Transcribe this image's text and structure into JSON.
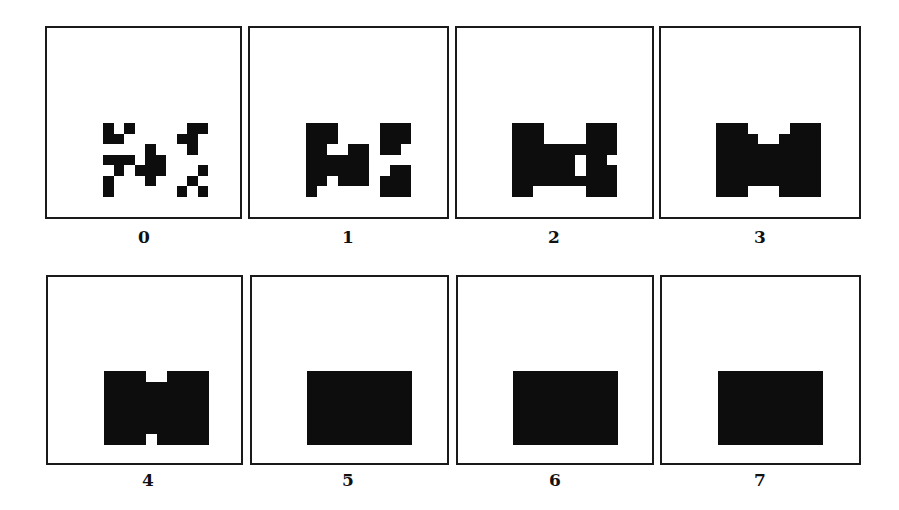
{
  "figure": {
    "grid": {
      "cols": 10,
      "rows": 7,
      "cell_color": "#0d0d0d",
      "background": "#ffffff"
    },
    "panels": [
      {
        "label": "0",
        "rows": [
          "X.X.....XX",
          "XX.....XX.",
          "....X...X.",
          "XXX.XX....",
          ".X.XXX...X",
          "X...X...X.",
          "X......X.X"
        ]
      },
      {
        "label": "1",
        "rows": [
          "XXX....XXX",
          "XXX....XXX",
          "XX..XX.XX.",
          "XXXXXX....",
          "XXXXXX..XX",
          "XX.XXX.XXX",
          "X......XXX"
        ]
      },
      {
        "label": "2",
        "rows": [
          "XXX....XXX",
          "XXX....XXX",
          "XXXXXXXXXX",
          "XXXXXX.XX.",
          "XXXXXX.XXX",
          "XXXXXXXXXX",
          "XX.....XXX"
        ]
      },
      {
        "label": "3",
        "rows": [
          "XXX....XXX",
          "XXXX..XXXX",
          "XXXXXXXXXX",
          "XXXXXXXXXX",
          "XXXXXXXXXX",
          "XXXXXXXXXX",
          "XXX...XXXX"
        ]
      },
      {
        "label": "4",
        "rows": [
          "XXXX..XXXX",
          "XXXXXXXXXX",
          "XXXXXXXXXX",
          "XXXXXXXXXX",
          "XXXXXXXXXX",
          "XXXXXXXXXX",
          "XXXX.XXXXX"
        ]
      },
      {
        "label": "5",
        "rows": [
          "XXXXXXXXXX",
          "XXXXXXXXXX",
          "XXXXXXXXXX",
          "XXXXXXXXXX",
          "XXXXXXXXXX",
          "XXXXXXXXXX",
          "XXXXXXXXXX"
        ]
      },
      {
        "label": "6",
        "rows": [
          "XXXXXXXXXX",
          "XXXXXXXXXX",
          "XXXXXXXXXX",
          "XXXXXXXXXX",
          "XXXXXXXXXX",
          "XXXXXXXXXX",
          "XXXXXXXXXX"
        ]
      },
      {
        "label": "7",
        "rows": [
          "XXXXXXXXXX",
          "XXXXXXXXXX",
          "XXXXXXXXXX",
          "XXXXXXXXXX",
          "XXXXXXXXXX",
          "XXXXXXXXXX",
          "XXXXXXXXXX"
        ]
      }
    ]
  }
}
